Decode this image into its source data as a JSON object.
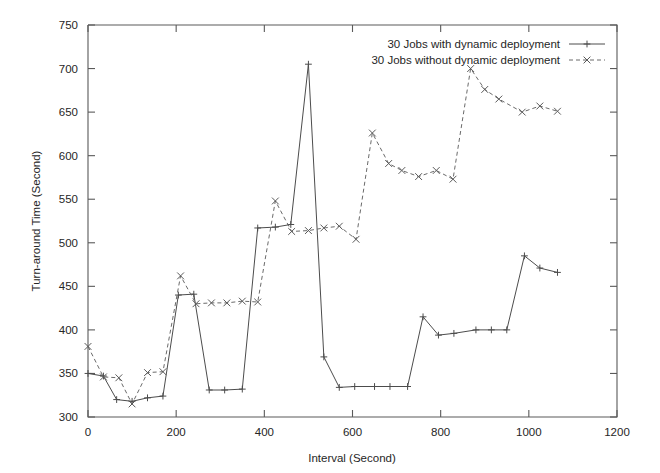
{
  "chart_data": {
    "type": "line",
    "title": "",
    "xlabel": "Interval (Second)",
    "ylabel": "Turn-around Time (Second)",
    "xlim": [
      0,
      1200
    ],
    "ylim": [
      300,
      750
    ],
    "xticks": [
      0,
      200,
      400,
      600,
      800,
      1000,
      1200
    ],
    "yticks": [
      300,
      350,
      400,
      450,
      500,
      550,
      600,
      650,
      700,
      750
    ],
    "xtick_labels": [
      "0",
      "200",
      "400",
      "600",
      "800",
      "1000",
      "1200"
    ],
    "ytick_labels": [
      "300",
      "350",
      "400",
      "450",
      "500",
      "550",
      "600",
      "650",
      "700",
      "750"
    ],
    "grid": false,
    "legend_position": "top-right",
    "series": [
      {
        "name": "30 Jobs with dynamic deployment",
        "marker": "plus",
        "linestyle": "solid",
        "color": "#4c4c4c",
        "x": [
          0,
          35,
          65,
          100,
          135,
          170,
          205,
          240,
          275,
          310,
          350,
          385,
          425,
          460,
          500,
          535,
          570,
          605,
          650,
          685,
          725,
          760,
          795,
          830,
          880,
          915,
          950,
          990,
          1025,
          1065
        ],
        "y": [
          350,
          347,
          320,
          318,
          322,
          324,
          440,
          441,
          331,
          331,
          332,
          517,
          518,
          521,
          705,
          369,
          334,
          335,
          335,
          335,
          335,
          415,
          394,
          396,
          400,
          400,
          400,
          485,
          471,
          466
        ]
      },
      {
        "name": "30 Jobs without dynamic deployment",
        "marker": "cross",
        "linestyle": "dashed",
        "color": "#6a6a6a",
        "x": [
          0,
          35,
          70,
          100,
          135,
          170,
          210,
          245,
          280,
          315,
          350,
          385,
          425,
          462,
          500,
          535,
          570,
          608,
          645,
          682,
          712,
          750,
          790,
          828,
          868,
          900,
          932,
          985,
          1025,
          1065
        ],
        "y": [
          381,
          346,
          345,
          315,
          351,
          352,
          462,
          430,
          431,
          431,
          433,
          432,
          548,
          513,
          514,
          517,
          519,
          504,
          626,
          591,
          583,
          576,
          583,
          573,
          700,
          676,
          665,
          650,
          657,
          651
        ]
      }
    ]
  },
  "legend": {
    "entries": [
      {
        "label": "30 Jobs with dynamic deployment",
        "style": "solid-plus"
      },
      {
        "label": "30 Jobs without dynamic deployment",
        "style": "dashed-cross"
      }
    ]
  }
}
